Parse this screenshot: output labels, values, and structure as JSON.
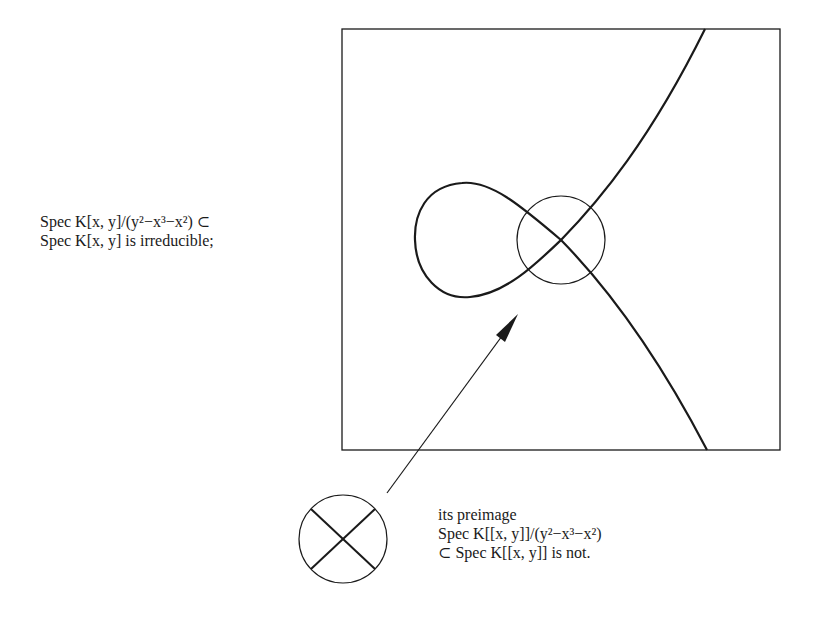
{
  "diagram": {
    "type": "algebraic-curve-illustration",
    "left_caption": {
      "line1": "Spec K[x, y]/(y²−x³−x²) ⊂",
      "line2": "Spec K[x, y] is irreducible;"
    },
    "right_caption": {
      "line1": "its preimage",
      "line2": "Spec K[[x, y]]/(y²−x³−x²)",
      "line3": "⊂ Spec K[[x, y]] is not."
    },
    "elements": {
      "frame": "rectangle",
      "curve": "nodal cubic y^2 = x^3 + x^2",
      "node_circle": "neighbourhood of the node",
      "arrow": "points from the local picture to the node",
      "local_picture": "circle with two crossing branches"
    },
    "colors": {
      "ink": "#1a1a1a",
      "background": "#ffffff"
    }
  }
}
